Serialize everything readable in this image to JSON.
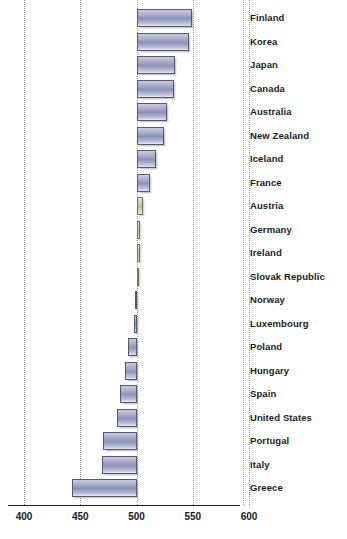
{
  "chart_data": {
    "type": "bar",
    "orientation": "horizontal",
    "title": "",
    "subtitle": "",
    "xlabel": "",
    "ylabel": "",
    "xlim": [
      400,
      600
    ],
    "baseline": 500,
    "xticks": [
      400,
      450,
      500,
      550,
      600
    ],
    "xtick_labels": [
      "400",
      "450",
      "500",
      "550",
      "600"
    ],
    "grid": true,
    "grid_axis": "x",
    "legend": "none",
    "categories": [
      "Finland",
      "Korea",
      "Japan",
      "Canada",
      "Australia",
      "New Zealand",
      "Iceland",
      "France",
      "Austria",
      "Germany",
      "Ireland",
      "Slovak Republic",
      "Norway",
      "Luxembourg",
      "Poland",
      "Hungary",
      "Spain",
      "United States",
      "Portugal",
      "Italy",
      "Greece"
    ],
    "values": [
      549,
      547,
      534,
      533,
      527,
      524,
      517,
      512,
      506,
      503,
      503,
      501,
      499,
      498,
      492,
      490,
      485,
      483,
      470,
      469,
      443
    ],
    "colors": [
      "#9ba0c4",
      "#9ba0c4",
      "#9ba0c4",
      "#9ba0c4",
      "#9ba0c4",
      "#9ba0c4",
      "#9ba0c4",
      "#9ba0c4",
      "#b9c495",
      "#b9c495",
      "#b9c495",
      "#b9c495",
      "#9ba0c4",
      "#9ba0c4",
      "#9ba0c4",
      "#9ba0c4",
      "#9ba0c4",
      "#9ba0c4",
      "#9ba0c4",
      "#9ba0c4",
      "#9ba0c4"
    ],
    "series": [
      {
        "name": "score",
        "values": [
          549,
          547,
          534,
          533,
          527,
          524,
          517,
          512,
          506,
          503,
          503,
          501,
          499,
          498,
          492,
          490,
          485,
          483,
          470,
          469,
          443
        ]
      }
    ],
    "accent_color_blue": "#9ba0c4",
    "accent_color_green": "#b9c495",
    "axis_color": "#1b1b1b",
    "grid_color": "#8e8e8e"
  }
}
